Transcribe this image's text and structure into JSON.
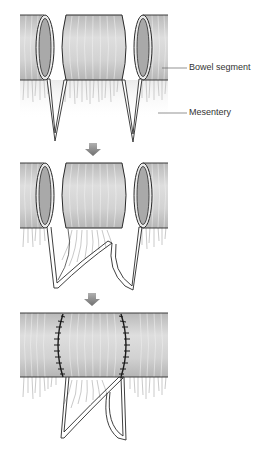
{
  "diagram": {
    "type": "surgical-illustration",
    "panels": [
      {
        "index": 1,
        "description": "Bowel segment isolated with V-shaped mesenteric incisions"
      },
      {
        "index": 2,
        "description": "Segment with mesentery prepared; ends approximated"
      },
      {
        "index": 3,
        "description": "Continuous bowel with two sutured anastomosis lines"
      }
    ],
    "labels": {
      "bowel_segment": "Bowel segment",
      "mesentery": "Mesentery"
    },
    "arrows": [
      {
        "from_panel": 1,
        "to_panel": 2,
        "direction": "down"
      },
      {
        "from_panel": 2,
        "to_panel": 3,
        "direction": "down"
      }
    ],
    "colors": {
      "bowel_fill": "#c9c9c9",
      "bowel_light": "#e4e4e4",
      "lumen_fill": "#a8a8a8",
      "outline": "#2a2a2a",
      "mesentery_line": "#9a9a9a",
      "arrow": "#8a8a8a",
      "suture": "#1a1a1a",
      "leader_line": "#666666"
    }
  }
}
